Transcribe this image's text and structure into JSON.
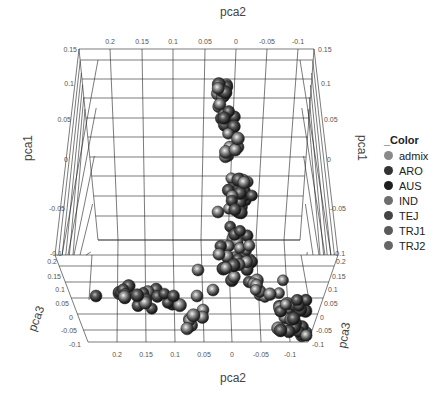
{
  "chart_data": {
    "type": "scatter",
    "title": "",
    "axes": {
      "pca1": {
        "label": "pca1",
        "ticks": [
          "0.15",
          "0.1",
          "0.05",
          "0",
          "-0.05",
          "-0.1"
        ]
      },
      "pca2": {
        "label": "pca2",
        "ticks": [
          "0.2",
          "0.15",
          "0.1",
          "0.05",
          "0",
          "-0.05",
          "-0.1"
        ]
      },
      "pca3": {
        "label": "pca3",
        "ticks": [
          "0.2",
          "0.15",
          "0.1",
          "0.05",
          "0",
          "-0.05",
          "-0.1"
        ]
      }
    },
    "legend": {
      "title": "_Color",
      "position": "right",
      "items": [
        {
          "label": "admix",
          "color": "#8a8a8a"
        },
        {
          "label": "ARO",
          "color": "#333333"
        },
        {
          "label": "AUS",
          "color": "#1e1e1e"
        },
        {
          "label": "IND",
          "color": "#6e6e6e"
        },
        {
          "label": "TEJ",
          "color": "#444444"
        },
        {
          "label": "TRJ1",
          "color": "#5a5a5a"
        },
        {
          "label": "TRJ2",
          "color": "#666666"
        }
      ]
    },
    "grid": true,
    "clusters": [
      {
        "name": "top-arm",
        "approx_screen_center": [
          230,
          110
        ]
      },
      {
        "name": "upper-center",
        "approx_screen_center": [
          240,
          190
        ]
      },
      {
        "name": "center",
        "approx_screen_center": [
          235,
          255
        ]
      },
      {
        "name": "left-arm",
        "approx_screen_center": [
          150,
          295
        ]
      },
      {
        "name": "right-arm",
        "approx_screen_center": [
          290,
          315
        ]
      }
    ]
  },
  "labels": {
    "top_pca2": "pca2",
    "bottom_pca2": "pca2",
    "left_pca1": "pca1",
    "right_pca1": "pca1",
    "left_pca3": "pca3",
    "right_pca3": "pca3"
  },
  "ticks": {
    "top_pca2": [
      "0.2",
      "0.15",
      "0.1",
      "0.05",
      "0",
      "-0.05",
      "-0.1"
    ],
    "bottom_pca2": [
      "0.2",
      "0.15",
      "0.1",
      "0.05",
      "0",
      "-0.05",
      "-0.1"
    ],
    "left_pca1": [
      "0.15",
      "0.1",
      "0.05",
      "0",
      "-0.05",
      "-0.1"
    ],
    "right_pca1": [
      "0.15",
      "0.1",
      "0.05",
      "0",
      "-0.05",
      "-0.1"
    ],
    "left_pca3": [
      "0.2",
      "0.15",
      "0.1",
      "0.05",
      "0",
      "-0.05",
      "-0.1"
    ],
    "right_pca3": [
      "0.2",
      "0.15",
      "0.1",
      "0.05",
      "0",
      "-0.05",
      "-0.1"
    ]
  }
}
